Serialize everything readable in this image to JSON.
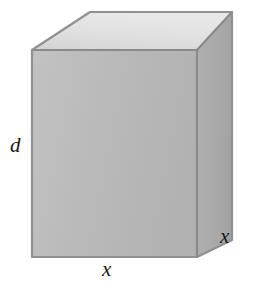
{
  "figure": {
    "name": "rectangular-box-diagram",
    "type": "3d-geometric-solid",
    "solid": "rectangular prism",
    "background_color": "#ffffff"
  },
  "labels": {
    "depth": "d",
    "width_bottom": "x",
    "width_right": "x"
  },
  "faces": {
    "front": {
      "name": "front-face",
      "fill": "#b8b8b8",
      "points": "32,50 197,50 197,257 32,257"
    },
    "top": {
      "name": "top-face",
      "fill": "#dedede",
      "points": "32,50 90,12 232,12 197,50"
    },
    "right": {
      "name": "right-face",
      "fill": "#aaaaaa",
      "points": "197,50 232,12 232,240 197,257"
    }
  },
  "edges": {
    "stroke": "#8a8a8a",
    "stroke_width": 2.2,
    "outline_stroke": "#909090"
  }
}
